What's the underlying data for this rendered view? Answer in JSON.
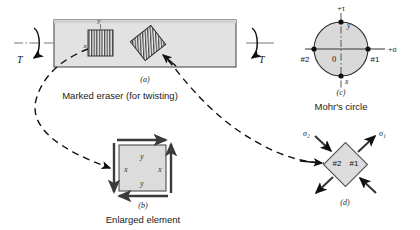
{
  "figure": {
    "title_parts": [
      "(a)",
      "(b)",
      "(c)",
      "(d)"
    ],
    "colors": {
      "body_fill": "#e2e2e2",
      "element_fill": "#dcdcdc",
      "circle_fill": "#d9d9d9",
      "stroke": "#1a1a1a",
      "axis": "#555555",
      "dashed": "#111111"
    }
  },
  "panel_a": {
    "label": "(a)",
    "caption": "Marked eraser (for twisting)",
    "torque_left": "T",
    "torque_right": "T",
    "axis_x_label": "x",
    "axis_y_label": "y"
  },
  "panel_b": {
    "label": "(b)",
    "caption": "Enlarged element",
    "face_labels": {
      "top": "y",
      "bottom": "y",
      "left": "x",
      "right": "x"
    }
  },
  "panel_c": {
    "label": "(c)",
    "caption": "Mohr's circle",
    "axis_tau": "+τ",
    "axis_sigma": "+σ",
    "origin": "0",
    "point_left": "#2",
    "point_right": "#1",
    "point_top": "y",
    "point_bottom": "x"
  },
  "panel_d": {
    "label": "(d)",
    "stress_1": "σ₁",
    "stress_2": "σ₂",
    "face_2": "#2",
    "face_1": "#1"
  }
}
